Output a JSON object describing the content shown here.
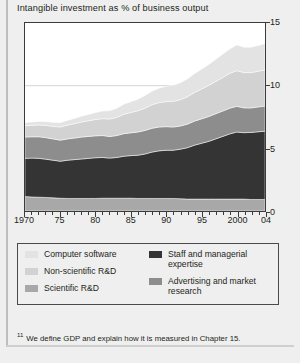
{
  "figure": {
    "title": "Intangible investment as % of business output",
    "footnote_marker": "11",
    "footnote": "We define GDP and explain how it is measured in Chapter 15."
  },
  "legend": {
    "column1": [
      {
        "label": "Computer software",
        "color": "#e3e3e3",
        "name": "legend-computer-software"
      },
      {
        "label": "Non-scientific R&D",
        "color": "#d2d2d2",
        "name": "legend-non-scientific-rd"
      },
      {
        "label": "Scientific R&D",
        "color": "#a8a8a8",
        "name": "legend-scientific-rd"
      }
    ],
    "column2": [
      {
        "label": "Staff and managerial expertise",
        "color": "#343434",
        "name": "legend-staff-managerial-expertise"
      },
      {
        "label": "Advertising and market research",
        "color": "#8d8d8d",
        "name": "legend-advertising-market-research"
      }
    ]
  },
  "chart_data": {
    "type": "area",
    "stacked": true,
    "title": "Intangible investment as % of business output",
    "xlabel": "",
    "ylabel": "",
    "xlim": [
      1970,
      2004
    ],
    "ylim": [
      0,
      15
    ],
    "yticks": [
      0,
      5,
      10,
      15
    ],
    "ytick_labels": [
      "0",
      "5",
      "10",
      "15"
    ],
    "y_axis_position": "right",
    "gridlines": [
      5,
      10
    ],
    "xticks": [
      1970,
      1975,
      1980,
      1985,
      1990,
      1995,
      2000,
      2004
    ],
    "xtick_labels": [
      "1970",
      "75",
      "80",
      "85",
      "90",
      "95",
      "2000",
      "04"
    ],
    "x": [
      1970,
      1971,
      1972,
      1973,
      1974,
      1975,
      1976,
      1977,
      1978,
      1979,
      1980,
      1981,
      1982,
      1983,
      1984,
      1985,
      1986,
      1987,
      1988,
      1989,
      1990,
      1991,
      1992,
      1993,
      1994,
      1995,
      1996,
      1997,
      1998,
      1999,
      2000,
      2001,
      2002,
      2003,
      2004
    ],
    "legend_position": "below",
    "series": [
      {
        "name": "Scientific R&D",
        "color": "#a8a8a8",
        "values": [
          1.15,
          1.12,
          1.1,
          1.08,
          1.05,
          1.02,
          1.0,
          1.0,
          1.0,
          1.0,
          1.0,
          1.02,
          1.02,
          1.02,
          1.02,
          1.02,
          1.0,
          1.0,
          1.0,
          1.0,
          1.0,
          1.0,
          0.98,
          0.95,
          0.95,
          0.95,
          0.95,
          0.95,
          0.95,
          0.95,
          0.95,
          0.95,
          0.92,
          0.92,
          0.92
        ]
      },
      {
        "name": "Staff and managerial expertise",
        "color": "#343434",
        "values": [
          3.05,
          3.1,
          3.1,
          3.05,
          3.0,
          2.95,
          3.05,
          3.1,
          3.15,
          3.2,
          3.25,
          3.25,
          3.2,
          3.25,
          3.35,
          3.4,
          3.45,
          3.55,
          3.7,
          3.8,
          3.85,
          3.85,
          3.95,
          4.1,
          4.3,
          4.45,
          4.6,
          4.8,
          5.0,
          5.2,
          5.35,
          5.3,
          5.35,
          5.4,
          5.45
        ]
      },
      {
        "name": "Advertising and market research",
        "color": "#8d8d8d",
        "values": [
          1.7,
          1.7,
          1.72,
          1.72,
          1.7,
          1.68,
          1.7,
          1.72,
          1.75,
          1.75,
          1.75,
          1.75,
          1.72,
          1.75,
          1.8,
          1.82,
          1.85,
          1.88,
          1.9,
          1.9,
          1.88,
          1.85,
          1.85,
          1.88,
          1.92,
          1.95,
          1.98,
          2.0,
          2.02,
          2.05,
          2.05,
          1.98,
          1.95,
          1.98,
          2.0
        ]
      },
      {
        "name": "Non-scientific R&D",
        "color": "#d2d2d2",
        "values": [
          0.9,
          0.92,
          0.95,
          0.98,
          1.0,
          1.05,
          1.1,
          1.15,
          1.2,
          1.25,
          1.3,
          1.35,
          1.4,
          1.45,
          1.55,
          1.62,
          1.7,
          1.78,
          1.88,
          1.95,
          2.0,
          2.05,
          2.1,
          2.18,
          2.28,
          2.38,
          2.48,
          2.58,
          2.68,
          2.78,
          2.85,
          2.82,
          2.82,
          2.85,
          2.88
        ]
      },
      {
        "name": "Computer software",
        "color": "#e3e3e3",
        "values": [
          0.25,
          0.26,
          0.28,
          0.3,
          0.32,
          0.35,
          0.38,
          0.42,
          0.46,
          0.5,
          0.55,
          0.6,
          0.66,
          0.72,
          0.8,
          0.86,
          0.92,
          1.0,
          1.08,
          1.15,
          1.22,
          1.28,
          1.35,
          1.42,
          1.5,
          1.58,
          1.66,
          1.75,
          1.85,
          1.95,
          2.05,
          2.02,
          2.02,
          2.05,
          2.1
        ]
      }
    ],
    "totals": [
      7.05,
      7.1,
      7.15,
      7.13,
      7.07,
      7.05,
      7.23,
      7.39,
      7.56,
      7.7,
      7.85,
      7.97,
      8.0,
      8.19,
      8.52,
      8.72,
      8.92,
      9.21,
      9.56,
      9.8,
      9.95,
      10.03,
      10.23,
      10.53,
      10.95,
      11.31,
      11.67,
      12.08,
      12.5,
      12.93,
      13.25,
      13.07,
      13.06,
      13.2,
      13.35
    ]
  }
}
